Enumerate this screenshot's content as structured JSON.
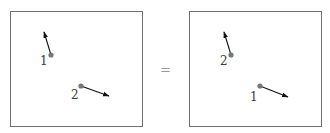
{
  "diagram": {
    "type": "particle-exchange-equivalence",
    "colors": {
      "frame": "#6e6e6e",
      "point": "#777777",
      "arrow": "#111111",
      "label": "#3a3a3a",
      "equals": "#9a9a9a"
    },
    "operator": "=",
    "panels": [
      {
        "name": "left",
        "frame": {
          "x": 10,
          "y": 11,
          "w": 132,
          "h": 115
        },
        "particles": [
          {
            "label": "1",
            "point": [
              51,
              55
            ],
            "arrow_tip": [
              44,
              32
            ],
            "label_pos": [
              40,
              65
            ]
          },
          {
            "label": "2",
            "point": [
              81,
              86
            ],
            "arrow_tip": [
              109,
              96
            ],
            "label_pos": [
              71,
              99
            ]
          }
        ]
      },
      {
        "name": "right",
        "frame": {
          "x": 189,
          "y": 11,
          "w": 132,
          "h": 115
        },
        "particles": [
          {
            "label": "2",
            "point": [
              231,
              55
            ],
            "arrow_tip": [
              224,
              32
            ],
            "label_pos": [
              220,
              65
            ]
          },
          {
            "label": "1",
            "point": [
              260,
              86
            ],
            "arrow_tip": [
              288,
              97
            ],
            "label_pos": [
              250,
              101
            ]
          }
        ]
      }
    ]
  }
}
